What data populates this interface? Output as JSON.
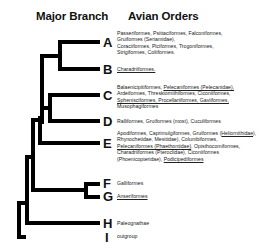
{
  "headers": {
    "major_branch": "Major Branch",
    "avian_orders": "Avian Orders"
  },
  "branches": [
    {
      "label": "A",
      "orders": [
        {
          "text": "Passeriformes, Psittaciformes, Falconiformes,",
          "u": false
        },
        {
          "text": "Gruiformes (Seriamidae),",
          "u": false
        },
        {
          "text": "Coraciiformes, Piciformes, Trogoniformes,",
          "u": false
        },
        {
          "text": "Strigiformes, Coliiformes.",
          "u": false
        }
      ]
    },
    {
      "label": "B",
      "orders": [
        {
          "text": "Charadriiformes.",
          "u": true
        }
      ]
    },
    {
      "label": "C",
      "orders": [
        {
          "text": "Balaenicipitiformes, ",
          "u": false
        },
        {
          "text": "Pelecaniformes (Pelecanidae),",
          "u": true
        },
        {
          "text": "Ardeiformes, Threskiornithiformes, Ciconiiformes,",
          "u": false
        },
        {
          "text": "Sphenisciformes, Procellariiformes, Gaviiformes,",
          "u": true
        },
        {
          "text": "Musophagiformes",
          "u": false
        }
      ]
    },
    {
      "label": "D",
      "orders": [
        {
          "text": "Ralliformes, Gruiformes (most), Cuculiformes",
          "u": false
        }
      ]
    },
    {
      "label": "E",
      "orders": [
        {
          "text": "Apodiformes, Caprimulgiformes, Gruiformes (",
          "u": false
        },
        {
          "text": "Heliornithidae",
          "u": true
        },
        {
          "text": "),",
          "u": false
        },
        {
          "text": "Rhynochetidae, Mesitidae), Columbiformes,",
          "u": false
        },
        {
          "text": "Pelecaniformes (Phaethontidae)",
          "u": true
        },
        {
          "text": ", Opisthocomiformes,",
          "u": false
        },
        {
          "text": "Charadriiformes (Pteroclidae), Ciconiiformes",
          "u": false
        },
        {
          "text": "(Phoenicopteridae), ",
          "u": false
        },
        {
          "text": "Podicipediformes",
          "u": true
        }
      ]
    },
    {
      "label": "F",
      "orders": [
        {
          "text": "Galliformes",
          "u": false
        }
      ]
    },
    {
      "label": "G",
      "orders": [
        {
          "text": "Anseriformes",
          "u": true
        }
      ]
    },
    {
      "label": "H",
      "orders": [
        {
          "text": "Paleognathae",
          "u": false
        }
      ]
    },
    {
      "label": "I",
      "orders": [
        {
          "text": "outgroup",
          "u": false
        }
      ]
    }
  ]
}
